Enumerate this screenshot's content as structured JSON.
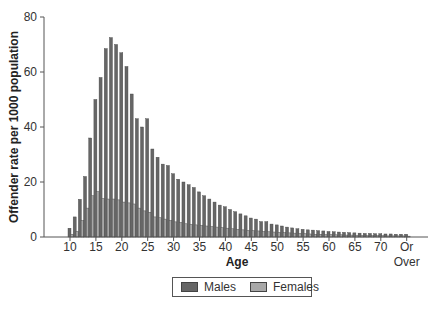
{
  "chart_data": {
    "type": "bar",
    "title": "",
    "xlabel": "Age",
    "ylabel": "Offender rate per 1000 population",
    "ylim": [
      0,
      80
    ],
    "yticks": [
      0,
      20,
      40,
      60,
      80
    ],
    "xtick_labels": [
      "10",
      "15",
      "20",
      "25",
      "30",
      "35",
      "40",
      "45",
      "50",
      "55",
      "60",
      "65",
      "70",
      "Or Over"
    ],
    "grid": false,
    "legend_position": "bottom-center",
    "categories": [
      10,
      11,
      12,
      13,
      14,
      15,
      16,
      17,
      18,
      19,
      20,
      21,
      22,
      23,
      24,
      25,
      26,
      27,
      28,
      29,
      30,
      31,
      32,
      33,
      34,
      35,
      36,
      37,
      38,
      39,
      40,
      41,
      42,
      43,
      44,
      45,
      46,
      47,
      48,
      49,
      50,
      51,
      52,
      53,
      54,
      55,
      56,
      57,
      58,
      59,
      60,
      61,
      62,
      63,
      64,
      65,
      66,
      67,
      68,
      69,
      70,
      71,
      72,
      73,
      74,
      "75 Or Over"
    ],
    "series": [
      {
        "name": "Males",
        "color": "#666666",
        "values": [
          3.2,
          7.3,
          13.7,
          22,
          36,
          50,
          58,
          68.5,
          72.5,
          70,
          67,
          62,
          52,
          43,
          40,
          43,
          32,
          29,
          26.5,
          26,
          23,
          21,
          20,
          19,
          18,
          16.4,
          15,
          13.8,
          12.7,
          11.6,
          11,
          10,
          9.2,
          8.4,
          7.7,
          6.9,
          6.5,
          5.6,
          5.6,
          4.7,
          4.4,
          4,
          3.6,
          3.3,
          3,
          2.8,
          2.6,
          2.5,
          2.3,
          2.2,
          2,
          1.9,
          1.8,
          1.7,
          1.6,
          1.5,
          1.4,
          1.3,
          1.3,
          1.2,
          1.2,
          1.1,
          1.1,
          1,
          1,
          1
        ]
      },
      {
        "name": "Females",
        "color": "#a8a8a8",
        "values": [
          1,
          2,
          6,
          10.5,
          15,
          16.5,
          14,
          13.8,
          13.8,
          13.5,
          12.7,
          12.4,
          12,
          10.5,
          9.5,
          9,
          7.3,
          7,
          6.5,
          6,
          5.5,
          5.3,
          4.8,
          4.6,
          4.4,
          4.2,
          4,
          3.8,
          3.6,
          3.4,
          3.2,
          3,
          2.8,
          2.6,
          2.4,
          2.3,
          2.2,
          2,
          1.9,
          1.8,
          1.7,
          1.6,
          1.5,
          1.4,
          1.3,
          1.2,
          1.1,
          1,
          1,
          0.9,
          0.9,
          0.8,
          0.8,
          0.7,
          0.7,
          0.6,
          0.6,
          0.5,
          0.5,
          0.5,
          0.5,
          0.4,
          0.4,
          0.4,
          0.4,
          0.3
        ]
      }
    ]
  },
  "legend": {
    "males_label": "Males",
    "females_label": "Females"
  }
}
